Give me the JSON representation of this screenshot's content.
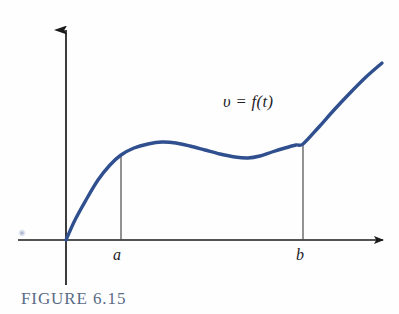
{
  "figure": {
    "caption": "FIGURE 6.15",
    "caption_color": "#5a6b85",
    "background_color": "#fefefe"
  },
  "labels": {
    "curve_label": "υ = f(t)",
    "a_label": "a",
    "b_label": "b"
  },
  "colors": {
    "curve": "#2f4f8f",
    "axis": "#1a1a1a",
    "ordinate_line": "#4a4a4a",
    "caption": "#5a6b85"
  },
  "chart_data": {
    "type": "line",
    "title": "",
    "subtitle": "",
    "xlabel": "",
    "ylabel": "",
    "legend": [],
    "annotations": [
      {
        "text": "υ = f(t)",
        "x_px": 223,
        "y_px": 94
      }
    ],
    "grid": false,
    "axes": {
      "x_axis": {
        "y_px": 240,
        "x_start_px": 18,
        "x_end_px": 388,
        "arrow": "right"
      },
      "y_axis": {
        "x_px": 66,
        "y_start_px": 285,
        "y_end_px": 22,
        "arrow": "up"
      }
    },
    "tick_labels": {
      "x": [
        "a",
        "b"
      ],
      "y": []
    },
    "marked_x_values": [
      {
        "label": "a",
        "x_px": 121,
        "curve_y_px": 155
      },
      {
        "label": "b",
        "x_px": 303,
        "curve_y_px": 144
      }
    ],
    "series": [
      {
        "name": "υ = f(t)",
        "color": "#2f4f8f",
        "points_px": [
          [
            66,
            240
          ],
          [
            75,
            220
          ],
          [
            86,
            200
          ],
          [
            98,
            180
          ],
          [
            110,
            165
          ],
          [
            121,
            155
          ],
          [
            134,
            148
          ],
          [
            148,
            144
          ],
          [
            162,
            142
          ],
          [
            176,
            143
          ],
          [
            190,
            146
          ],
          [
            205,
            150
          ],
          [
            220,
            154
          ],
          [
            235,
            157
          ],
          [
            248,
            158
          ],
          [
            260,
            156
          ],
          [
            272,
            152
          ],
          [
            285,
            148
          ],
          [
            296,
            145
          ],
          [
            303,
            144
          ],
          [
            318,
            128
          ],
          [
            334,
            110
          ],
          [
            350,
            93
          ],
          [
            366,
            77
          ],
          [
            382,
            63
          ]
        ]
      }
    ],
    "key_features": {
      "start": {
        "x_px": 66,
        "y_px": 240,
        "note": "origin"
      },
      "local_max": {
        "x_px": 168,
        "y_px": 142
      },
      "local_min": {
        "x_px": 248,
        "y_px": 158
      },
      "end": {
        "x_px": 382,
        "y_px": 63
      }
    }
  }
}
